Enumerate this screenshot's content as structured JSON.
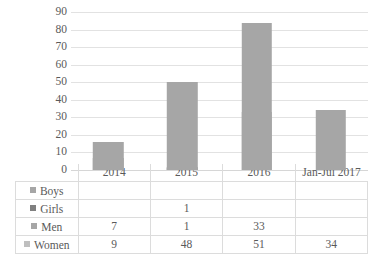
{
  "chart_data": {
    "type": "bar",
    "subtype": "stacked-column-with-data-table",
    "title": "",
    "xlabel": "",
    "ylabel": "",
    "categories": [
      "2014",
      "2015",
      "2016",
      "Jan-Jul 2017"
    ],
    "series": [
      {
        "name": "Boys",
        "values": [
          null,
          null,
          null,
          null
        ],
        "color": "#a6a6a6"
      },
      {
        "name": "Girls",
        "values": [
          null,
          1,
          null,
          null
        ],
        "color": "#808080"
      },
      {
        "name": "Men",
        "values": [
          7,
          1,
          33,
          null
        ],
        "color": "#a6a6a6"
      },
      {
        "name": "Women",
        "values": [
          9,
          48,
          51,
          34
        ],
        "color": "#bfbfbf"
      }
    ],
    "totals": [
      16,
      50,
      84,
      34
    ],
    "yticks": [
      0,
      10,
      20,
      30,
      40,
      50,
      60,
      70,
      80,
      90
    ],
    "ylim": [
      0,
      90
    ],
    "grid": true,
    "legend_position": "data-table-row-labels",
    "bar_color": "#a6a6a6",
    "gridline_color": "#e2e2e2",
    "table_border_color": "#dcdcdc",
    "text_color": "#5a5a5a"
  },
  "table": {
    "column_headers": [
      "",
      "2014",
      "2015",
      "2016",
      "Jan-Jul 2017"
    ],
    "rows": [
      {
        "label": "Boys",
        "marker": "legend-swatch",
        "cells": [
          "",
          "",
          "",
          ""
        ]
      },
      {
        "label": "Girls",
        "marker": "legend-swatch",
        "cells": [
          "",
          "1",
          "",
          ""
        ]
      },
      {
        "label": "Men",
        "marker": "legend-swatch",
        "cells": [
          "7",
          "1",
          "33",
          ""
        ]
      },
      {
        "label": "Women",
        "marker": "legend-swatch",
        "cells": [
          "9",
          "48",
          "51",
          "34"
        ]
      }
    ]
  }
}
